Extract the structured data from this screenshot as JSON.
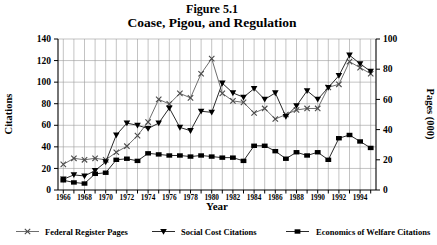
{
  "title": {
    "line1": "Figure 5.1",
    "line2": "Coase, Pigou, and Regulation"
  },
  "chart_data": {
    "type": "line",
    "title": "Figure 5.1",
    "subtitle": "Coase, Pigou, and Regulation",
    "xlabel": "Year",
    "ylabel_left": "Citations",
    "ylabel_right": "Pages (000)",
    "ylim_left": [
      0,
      140
    ],
    "ylim_right": [
      0,
      100
    ],
    "ytick_step_left": 20,
    "ytick_step_right": 20,
    "grid": true,
    "legend_position": "bottom",
    "x": [
      1966,
      1967,
      1968,
      1969,
      1970,
      1971,
      1972,
      1973,
      1974,
      1975,
      1976,
      1977,
      1978,
      1979,
      1980,
      1981,
      1982,
      1983,
      1984,
      1985,
      1986,
      1987,
      1988,
      1989,
      1990,
      1991,
      1992,
      1993,
      1994,
      1995
    ],
    "xtick_labels": [
      "1966",
      "1968",
      "1970",
      "1972",
      "1974",
      "1976",
      "1978",
      "1980",
      "1982",
      "1984",
      "1986",
      "1988",
      "1990",
      "1992",
      "1994"
    ],
    "series": [
      {
        "name": "Federal Register Pages",
        "axis": "right",
        "marker": "x",
        "line_color": "#6e6e6e",
        "marker_color": "#4a4a4a",
        "values": [
          17,
          21,
          20,
          21,
          20,
          25,
          29,
          36,
          45,
          60,
          57,
          64,
          61,
          77,
          87,
          64,
          59,
          58,
          51,
          54,
          47,
          50,
          53,
          54,
          54,
          68,
          70,
          85,
          81,
          77
        ]
      },
      {
        "name": "Social Cost Citations",
        "axis": "left",
        "marker": "triangle-down",
        "line_color": "#2a2a2a",
        "marker_color": "#000000",
        "values": [
          10,
          14,
          13,
          18,
          26,
          51,
          62,
          60,
          57,
          62,
          76,
          58,
          55,
          73,
          72,
          99,
          90,
          86,
          94,
          84,
          90,
          68,
          78,
          92,
          84,
          95,
          106,
          125,
          117,
          110
        ]
      },
      {
        "name": "Economics of Welfare Citations",
        "axis": "left",
        "marker": "square",
        "line_color": "#2a2a2a",
        "marker_color": "#000000",
        "values": [
          9,
          7,
          6,
          15,
          16,
          28,
          29,
          27,
          34,
          33,
          32,
          32,
          31,
          32,
          31,
          30,
          30,
          27,
          41,
          41,
          36,
          29,
          35,
          32,
          35,
          28,
          48,
          51,
          45,
          39
        ]
      }
    ],
    "colors": {
      "grid": "#9a9a9a",
      "axis": "#000000",
      "background": "#ffffff"
    }
  }
}
